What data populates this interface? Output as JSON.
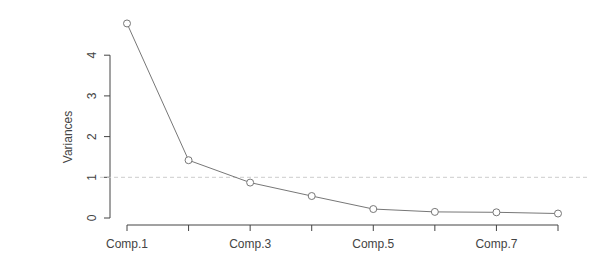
{
  "chart_data": {
    "type": "line",
    "title": "",
    "xlabel": "",
    "ylabel": "Variances",
    "categories": [
      "Comp.1",
      "Comp.2",
      "Comp.3",
      "Comp.4",
      "Comp.5",
      "Comp.6",
      "Comp.7",
      "Comp.8"
    ],
    "x_tick_labels_shown": [
      "Comp.1",
      "Comp.3",
      "Comp.5",
      "Comp.7"
    ],
    "values": [
      4.78,
      1.42,
      0.87,
      0.54,
      0.22,
      0.15,
      0.14,
      0.11
    ],
    "yticks": [
      0,
      1,
      2,
      3,
      4
    ],
    "ylim": [
      0,
      4.8
    ],
    "reference_line": {
      "y": 1,
      "style": "dashed"
    },
    "grid": false,
    "legend": null,
    "markers": "open-circle",
    "colors": {
      "line": "#777777",
      "axis": "#444444",
      "reference": "#cccccc"
    }
  }
}
